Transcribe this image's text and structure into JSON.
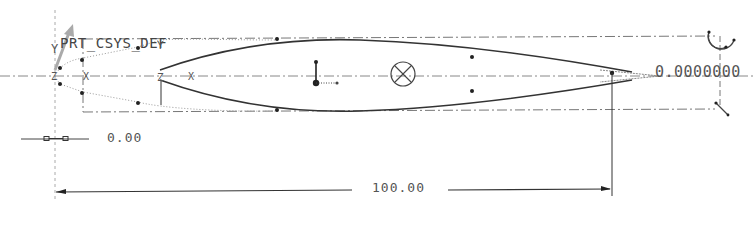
{
  "sketch": {
    "coordinate_system": {
      "name": "PRT_CSYS_DEF",
      "axes": [
        "Y",
        "Z",
        "X"
      ],
      "secondary_axes": [
        "Y",
        "Z",
        "X"
      ]
    },
    "dimensions": {
      "angle": "0.0000000",
      "offset": "0.00",
      "chord_length": "100.00"
    },
    "colors": {
      "geometry": "#333333",
      "construction": "#777777",
      "dimension_text": "#555555",
      "csys_arrow": "#999999"
    }
  }
}
